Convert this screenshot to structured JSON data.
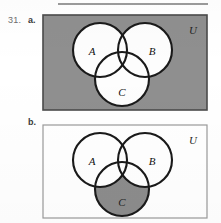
{
  "exercise": {
    "number": "31.",
    "parts": [
      {
        "key": "a",
        "label": "a."
      },
      {
        "key": "b",
        "label": "b."
      }
    ]
  },
  "colors": {
    "shade_gray": "#8f8f8f",
    "shade_gray_b": "#8c8c8c",
    "circle_fill": "#ffffff",
    "stroke_dark": "#1a1a1a",
    "panel_border_a": "#4a4a4a",
    "panel_border_b": "#9a9a9a",
    "page_background": "#ffffff"
  },
  "panel_a": {
    "name": "venn-diagram-a",
    "universe_label": "U",
    "universe_fill": "shaded",
    "set_labels": [
      "A",
      "B",
      "C"
    ],
    "shaded_region": "complement-of-A-union-B-union-C",
    "circles": [
      {
        "label": "A",
        "cx": 58,
        "cy": 36,
        "r": 27
      },
      {
        "label": "B",
        "cx": 103,
        "cy": 36,
        "r": 27
      },
      {
        "label": "C",
        "cx": 80,
        "cy": 65,
        "r": 27
      }
    ],
    "label_positions": [
      {
        "text": "A",
        "x": 50,
        "y": 41
      },
      {
        "text": "B",
        "x": 107,
        "y": 41
      },
      {
        "text": "C",
        "x": 80,
        "y": 83
      },
      {
        "text": "U",
        "x": 151,
        "y": 19
      }
    ]
  },
  "panel_b": {
    "name": "venn-diagram-b",
    "universe_label": "U",
    "universe_fill": "unshaded",
    "set_labels": [
      "A",
      "B",
      "C"
    ],
    "shaded_region": "C-minus-A-union-B",
    "circles": [
      {
        "label": "A",
        "cx": 58,
        "cy": 36,
        "r": 27
      },
      {
        "label": "B",
        "cx": 103,
        "cy": 36,
        "r": 27
      },
      {
        "label": "C",
        "cx": 80,
        "cy": 65,
        "r": 27
      }
    ],
    "label_positions": [
      {
        "text": "A",
        "x": 50,
        "y": 41
      },
      {
        "text": "B",
        "x": 107,
        "y": 41
      },
      {
        "text": "C",
        "x": 80,
        "y": 83
      },
      {
        "text": "U",
        "x": 151,
        "y": 19
      }
    ]
  }
}
